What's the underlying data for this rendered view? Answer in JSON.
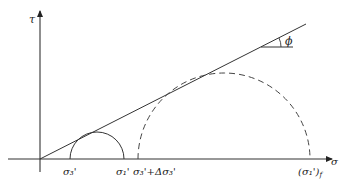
{
  "diagram": {
    "type": "mohr-coulomb-diagram",
    "axes": {
      "x_label": "σ",
      "y_label": "τ"
    },
    "failure_envelope": {
      "angle_label": "ϕ"
    },
    "labels": {
      "sigma3": "σ₃'",
      "sigma1": "σ₁'",
      "sigma3_plus_delta": "σ₃'+Δσ₃'",
      "sigma1_f_open": "(σ₁')",
      "sigma1_f_sub": "f"
    },
    "circles": [
      {
        "name": "initial-mohr-circle",
        "style": "solid",
        "from": "σ₃'",
        "to": "σ₁'"
      },
      {
        "name": "failure-mohr-circle",
        "style": "dashed",
        "from": "σ₃'+Δσ₃'",
        "to": "(σ₁')f"
      }
    ]
  }
}
